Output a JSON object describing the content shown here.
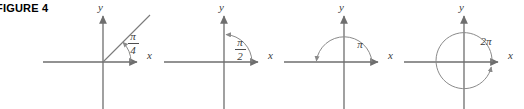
{
  "figure": {
    "caption": "FIGURE 4",
    "caption_color": "#000000",
    "background": "#ffffff",
    "axis_color": "#6e6e6e",
    "curve_color": "#8a8a8a",
    "ray_color": "#7a7a7a",
    "label_color": "#3a3a3a",
    "width": 524,
    "height": 109
  },
  "panels": [
    {
      "name": "panel-pi-over-4",
      "angle_label": "π/4",
      "angle_numerator": "π",
      "angle_denominator": "4",
      "angle_is_fraction": true,
      "angle_radians": 0.7853981634,
      "angle_degrees": 45,
      "x_axis_label": "x",
      "y_axis_label": "y",
      "terminal_side": "ray at 45 degrees",
      "arc_direction": "counterclockwise",
      "origin_x": 103,
      "origin_y": 62
    },
    {
      "name": "panel-pi-over-2",
      "angle_label": "π/2",
      "angle_numerator": "π",
      "angle_denominator": "2",
      "angle_is_fraction": true,
      "angle_radians": 1.5707963268,
      "angle_degrees": 90,
      "x_axis_label": "x",
      "y_axis_label": "y",
      "terminal_side": "positive y-axis",
      "arc_direction": "counterclockwise",
      "origin_x": 224,
      "origin_y": 62
    },
    {
      "name": "panel-pi",
      "angle_label": "π",
      "angle_numerator": "π",
      "angle_denominator": "",
      "angle_is_fraction": false,
      "angle_radians": 3.1415926536,
      "angle_degrees": 180,
      "x_axis_label": "x",
      "y_axis_label": "y",
      "terminal_side": "negative x-axis",
      "arc_direction": "counterclockwise",
      "origin_x": 344,
      "origin_y": 62
    },
    {
      "name": "panel-two-pi",
      "angle_label": "2π",
      "angle_numerator": "2π",
      "angle_denominator": "",
      "angle_is_fraction": false,
      "angle_radians": 6.2831853072,
      "angle_degrees": 360,
      "x_axis_label": "x",
      "y_axis_label": "y",
      "terminal_side": "positive x-axis (full revolution)",
      "arc_direction": "counterclockwise",
      "origin_x": 464,
      "origin_y": 62
    }
  ]
}
